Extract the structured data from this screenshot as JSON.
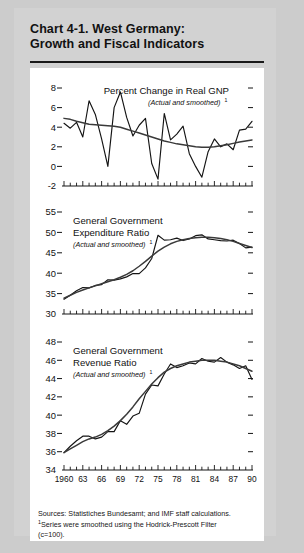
{
  "header": {
    "title_line1": "Chart 4-1.  West Germany:",
    "title_line2": "Growth and Fiscal Indicators"
  },
  "notes": {
    "sources": "Sources:  Statistiches Bundesamt; and IMF staff calculations.",
    "footnote_marker": "1",
    "footnote_line1": "Series were smoothed using the Hodrick-Prescott Filter",
    "footnote_line2": "(c=100)."
  },
  "x_axis": {
    "tick_labels": [
      "1960",
      "63",
      "66",
      "69",
      "72",
      "75",
      "78",
      "81",
      "84",
      "87",
      "90"
    ],
    "years": [
      1960,
      1961,
      1962,
      1963,
      1964,
      1965,
      1966,
      1967,
      1968,
      1969,
      1970,
      1971,
      1972,
      1973,
      1974,
      1975,
      1976,
      1977,
      1978,
      1979,
      1980,
      1981,
      1982,
      1983,
      1984,
      1985,
      1986,
      1987,
      1988,
      1989,
      1990
    ],
    "range": [
      1960,
      1990
    ]
  },
  "chart_data": [
    {
      "type": "line",
      "panel": 1,
      "title": "Percent Change in Real GNP",
      "subtitle": "(Actual and smoothed)",
      "subtitle_sup": "1",
      "xlabel": "",
      "ylabel": "",
      "ylim": [
        -2,
        8
      ],
      "ytick_labels": [
        "8",
        "6",
        "4",
        "2",
        "0",
        "-2"
      ],
      "yticks": [
        8,
        6,
        4,
        2,
        0,
        -2
      ],
      "grid": false,
      "legend": "none",
      "x": [
        1960,
        1961,
        1962,
        1963,
        1964,
        1965,
        1966,
        1967,
        1968,
        1969,
        1970,
        1971,
        1972,
        1973,
        1974,
        1975,
        1976,
        1977,
        1978,
        1979,
        1980,
        1981,
        1982,
        1983,
        1984,
        1985,
        1986,
        1987,
        1988,
        1989,
        1990
      ],
      "series": [
        {
          "name": "Actual",
          "values": [
            4.4,
            3.9,
            4.5,
            3.0,
            6.7,
            5.3,
            2.8,
            0.0,
            6.0,
            7.6,
            5.0,
            3.1,
            4.2,
            4.9,
            0.3,
            -1.3,
            5.4,
            2.7,
            3.3,
            4.1,
            1.3,
            0.0,
            -1.1,
            1.5,
            2.8,
            2.0,
            2.3,
            1.7,
            3.7,
            3.8,
            4.6
          ]
        },
        {
          "name": "Smoothed",
          "values": [
            4.9,
            4.8,
            4.6,
            4.45,
            4.3,
            4.25,
            4.2,
            4.15,
            4.1,
            4.0,
            3.8,
            3.6,
            3.4,
            3.2,
            3.0,
            2.8,
            2.6,
            2.45,
            2.3,
            2.2,
            2.1,
            2.0,
            1.95,
            1.95,
            2.0,
            2.1,
            2.2,
            2.35,
            2.5,
            2.6,
            2.7
          ]
        }
      ]
    },
    {
      "type": "line",
      "panel": 2,
      "title_line1": "General Government",
      "title_line2": "Expenditure Ratio",
      "subtitle": "(Actual and smoothed)",
      "subtitle_sup": "1",
      "xlabel": "",
      "ylabel": "",
      "ylim": [
        30,
        55
      ],
      "ytick_labels": [
        "55",
        "50",
        "45",
        "40",
        "35",
        "30"
      ],
      "yticks": [
        55,
        50,
        45,
        40,
        35,
        30
      ],
      "grid": false,
      "legend": "none",
      "x": [
        1960,
        1961,
        1962,
        1963,
        1964,
        1965,
        1966,
        1967,
        1968,
        1969,
        1970,
        1971,
        1972,
        1973,
        1974,
        1975,
        1976,
        1977,
        1978,
        1979,
        1980,
        1981,
        1982,
        1983,
        1984,
        1985,
        1986,
        1987,
        1988,
        1989,
        1990
      ],
      "series": [
        {
          "name": "Actual",
          "values": [
            33.6,
            34.6,
            35.7,
            36.5,
            36.4,
            37.0,
            37.2,
            38.4,
            38.3,
            38.6,
            39.1,
            39.9,
            39.9,
            41.3,
            43.6,
            49.3,
            48.1,
            48.2,
            48.6,
            48.0,
            48.4,
            49.2,
            49.4,
            48.4,
            48.2,
            48.0,
            47.9,
            48.1,
            47.3,
            46.2,
            46.4
          ]
        },
        {
          "name": "Smoothed",
          "values": [
            33.9,
            34.6,
            35.3,
            35.9,
            36.4,
            36.9,
            37.4,
            37.9,
            38.4,
            39.0,
            39.7,
            40.6,
            41.7,
            42.9,
            44.2,
            45.4,
            46.4,
            47.2,
            47.8,
            48.2,
            48.5,
            48.7,
            48.8,
            48.8,
            48.7,
            48.5,
            48.2,
            47.8,
            47.3,
            46.8,
            46.3
          ]
        }
      ]
    },
    {
      "type": "line",
      "panel": 3,
      "title_line1": "General Government",
      "title_line2": "Revenue Ratio",
      "subtitle": "(Actual and smoothed)",
      "subtitle_sup": "1",
      "xlabel": "",
      "ylabel": "",
      "ylim": [
        34,
        48
      ],
      "ytick_labels": [
        "48",
        "46",
        "44",
        "42",
        "40",
        "38",
        "36",
        "34"
      ],
      "yticks": [
        48,
        46,
        44,
        42,
        40,
        38,
        36,
        34
      ],
      "grid": false,
      "legend": "none",
      "x": [
        1960,
        1961,
        1962,
        1963,
        1964,
        1965,
        1966,
        1967,
        1968,
        1969,
        1970,
        1971,
        1972,
        1973,
        1974,
        1975,
        1976,
        1977,
        1978,
        1979,
        1980,
        1981,
        1982,
        1983,
        1984,
        1985,
        1986,
        1987,
        1988,
        1989,
        1990
      ],
      "series": [
        {
          "name": "Actual",
          "values": [
            35.9,
            36.6,
            37.2,
            37.7,
            37.7,
            37.4,
            37.6,
            38.2,
            38.2,
            39.4,
            39.0,
            39.9,
            40.2,
            42.3,
            43.3,
            43.2,
            44.5,
            45.6,
            45.2,
            45.4,
            45.7,
            45.6,
            46.2,
            45.9,
            45.8,
            46.3,
            45.8,
            45.5,
            45.1,
            45.4,
            43.9
          ]
        },
        {
          "name": "Smoothed",
          "values": [
            35.9,
            36.3,
            36.7,
            37.1,
            37.4,
            37.6,
            37.9,
            38.3,
            38.8,
            39.4,
            40.1,
            40.9,
            41.8,
            42.6,
            43.4,
            44.1,
            44.7,
            45.1,
            45.4,
            45.6,
            45.8,
            45.9,
            46.0,
            46.0,
            46.0,
            45.9,
            45.8,
            45.6,
            45.4,
            45.1,
            44.8
          ]
        }
      ]
    }
  ]
}
